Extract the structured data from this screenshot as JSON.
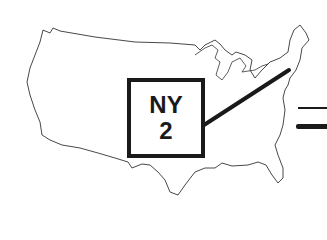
{
  "map": {
    "region": "United States (contiguous)",
    "outline_color": "#333333",
    "background": "#ffffff"
  },
  "label": {
    "state": "NY",
    "district": "2"
  },
  "legend": {
    "lines": [
      {
        "style": "thin"
      },
      {
        "style": "thick"
      }
    ]
  }
}
